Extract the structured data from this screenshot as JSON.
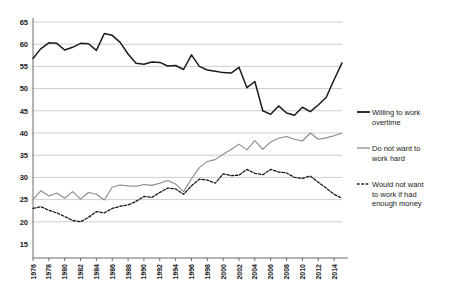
{
  "chart_data": {
    "type": "line",
    "title": "",
    "xlabel": "",
    "ylabel": "",
    "ylim": [
      15,
      65
    ],
    "yticks": [
      15,
      20,
      25,
      30,
      35,
      40,
      45,
      50,
      55,
      60,
      65
    ],
    "grid": true,
    "legend_position": "right",
    "x": [
      1976,
      1977,
      1978,
      1979,
      1980,
      1981,
      1982,
      1983,
      1984,
      1985,
      1986,
      1987,
      1988,
      1989,
      1990,
      1991,
      1992,
      1993,
      1994,
      1995,
      1996,
      1997,
      1998,
      1999,
      2000,
      2001,
      2002,
      2003,
      2004,
      2005,
      2006,
      2007,
      2008,
      2009,
      2010,
      2011,
      2012,
      2013,
      2014,
      2015
    ],
    "xticklabels": [
      "1976",
      "1978",
      "1980",
      "1982",
      "1984",
      "1986",
      "1988",
      "1990",
      "1992",
      "1994",
      "1996",
      "1998",
      "2000",
      "2002",
      "2004",
      "2006",
      "2008",
      "2010",
      "2012",
      "2014"
    ],
    "xtick_step": 2,
    "series": [
      {
        "name": "Willing to work overtime",
        "style": "solid",
        "color": "#1a1a1a",
        "values": [
          56.8,
          59.0,
          60.3,
          60.2,
          58.7,
          59.3,
          60.2,
          60.1,
          58.6,
          62.4,
          62.0,
          60.4,
          57.8,
          55.7,
          55.5,
          56.0,
          55.9,
          55.1,
          55.2,
          54.3,
          57.6,
          55.0,
          54.2,
          53.9,
          53.6,
          53.5,
          54.8,
          50.2,
          51.6,
          45.0,
          44.2,
          46.1,
          44.5,
          44.0,
          45.8,
          44.8,
          46.3,
          48.0,
          52.0,
          55.8
        ]
      },
      {
        "name": "Do not want to work hard",
        "style": "solid",
        "color": "#8a8a8a",
        "values": [
          25.0,
          27.0,
          25.8,
          26.5,
          25.3,
          26.8,
          25.1,
          26.6,
          26.2,
          24.9,
          27.8,
          28.3,
          28.1,
          28.0,
          28.4,
          28.2,
          28.7,
          29.3,
          28.5,
          26.8,
          29.7,
          32.2,
          33.6,
          34.0,
          35.2,
          36.3,
          37.5,
          36.2,
          38.3,
          36.3,
          38.0,
          38.8,
          39.2,
          38.6,
          38.2,
          40.0,
          38.6,
          38.9,
          39.4,
          40.0
        ]
      },
      {
        "name": "Would not want to work if had enough money",
        "style": "dashed",
        "color": "#1a1a1a",
        "values": [
          23.0,
          23.4,
          22.6,
          22.0,
          21.2,
          20.3,
          20.0,
          21.0,
          22.3,
          22.0,
          23.0,
          23.5,
          23.8,
          24.6,
          25.7,
          25.5,
          26.6,
          27.6,
          27.4,
          26.2,
          28.1,
          29.6,
          29.4,
          28.7,
          30.8,
          30.4,
          30.5,
          31.8,
          30.9,
          30.6,
          31.8,
          31.2,
          31.0,
          30.0,
          29.8,
          30.3,
          28.9,
          27.6,
          26.2,
          25.3
        ]
      }
    ]
  },
  "legend": {
    "entries": [
      {
        "label": "Willing to work overtime",
        "key": "solid-black-line-icon"
      },
      {
        "label": "Do not want to work hard",
        "key": "solid-gray-line-icon"
      },
      {
        "label": "Would not want to work if had enough money",
        "key": "dashed-black-line-icon"
      }
    ]
  }
}
